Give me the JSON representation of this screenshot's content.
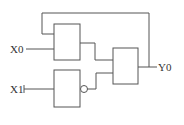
{
  "diagram": {
    "type": "logic-circuit",
    "inputs": [
      {
        "id": "x0",
        "label": "X0"
      },
      {
        "id": "x1",
        "label": "X1"
      }
    ],
    "outputs": [
      {
        "id": "y0",
        "label": "Y0"
      }
    ],
    "gates": [
      {
        "id": "gate-1",
        "kind": "box",
        "inputs": [
          "Y0 (feedback)",
          "X0"
        ]
      },
      {
        "id": "gate-2",
        "kind": "box-inverted-output",
        "inputs": [
          "X1"
        ]
      },
      {
        "id": "gate-3",
        "kind": "box",
        "inputs": [
          "gate-1",
          "gate-2"
        ]
      }
    ],
    "colors": {
      "line": "#555555",
      "background": "#ffffff"
    }
  }
}
